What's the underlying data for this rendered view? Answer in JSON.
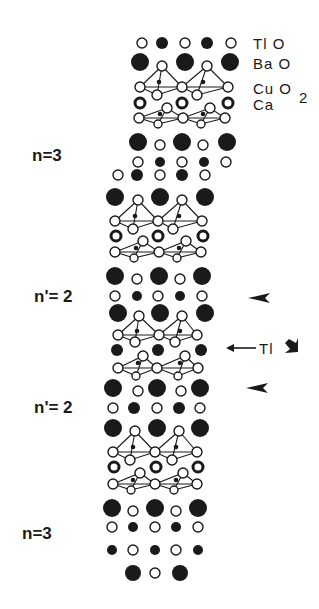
{
  "colors": {
    "ink": "#1a1a1a",
    "background": "#ffffff"
  },
  "legend": {
    "tlo": "Tl O",
    "bao": "Ba O",
    "cuo2": "Cu O",
    "cuo2_sub": "2",
    "ca": "Ca"
  },
  "side_labels": [
    {
      "text": "n=3",
      "x": 32,
      "y": 146
    },
    {
      "text": "n'= 2",
      "x": 34,
      "y": 287
    },
    {
      "text": "n'= 2",
      "x": 34,
      "y": 398
    },
    {
      "text": "n=3",
      "x": 22,
      "y": 524
    }
  ],
  "annotations": {
    "tl_arrow_label": "Tl",
    "arrowheads": [
      {
        "x": 248,
        "y": 298
      },
      {
        "x": 246,
        "y": 388
      }
    ],
    "down_arrow": {
      "x": 292,
      "y": 347
    }
  },
  "atom_rows": [
    {
      "y": 43,
      "atoms": [
        [
          142,
          "o",
          5
        ],
        [
          162,
          "f",
          6
        ],
        [
          185,
          "o",
          5
        ],
        [
          207,
          "f",
          6
        ],
        [
          231,
          "o",
          5
        ]
      ]
    },
    {
      "y": 62,
      "atoms": [
        [
          140,
          "F",
          9
        ],
        [
          185,
          "F",
          9
        ],
        [
          230,
          "F",
          9
        ]
      ]
    },
    {
      "y": 66,
      "atoms": [
        [
          162,
          "o",
          5
        ],
        [
          207,
          "o",
          5
        ]
      ]
    },
    {
      "y": 87,
      "atoms": [
        [
          140,
          "o",
          5
        ],
        [
          182,
          "o",
          5
        ],
        [
          228,
          "o",
          5
        ]
      ]
    },
    {
      "y": 95,
      "atoms": [
        [
          157,
          "o",
          5
        ],
        [
          197,
          "o",
          5
        ]
      ]
    },
    {
      "y": 103,
      "atoms": [
        [
          140,
          "r",
          5
        ],
        [
          182,
          "r",
          5
        ],
        [
          228,
          "r",
          5
        ]
      ]
    },
    {
      "y": 108,
      "atoms": [
        [
          167,
          "o",
          5
        ],
        [
          210,
          "o",
          5
        ]
      ]
    },
    {
      "y": 118,
      "atoms": [
        [
          139,
          "o",
          5
        ],
        [
          183,
          "o",
          5
        ],
        [
          225,
          "o",
          5
        ]
      ]
    },
    {
      "y": 124,
      "atoms": [
        [
          158,
          "o",
          4
        ],
        [
          201,
          "o",
          4
        ]
      ]
    },
    {
      "y": 142,
      "atoms": [
        [
          138,
          "F",
          9
        ],
        [
          182,
          "F",
          9
        ],
        [
          227,
          "F",
          9
        ]
      ]
    },
    {
      "y": 145,
      "atoms": [
        [
          160,
          "o",
          5
        ],
        [
          203,
          "o",
          5
        ]
      ]
    },
    {
      "y": 162,
      "atoms": [
        [
          138,
          "o",
          5
        ],
        [
          160,
          "f",
          5
        ],
        [
          182,
          "o",
          5
        ],
        [
          204,
          "f",
          5
        ],
        [
          226,
          "o",
          5
        ]
      ]
    },
    {
      "y": 175,
      "atoms": [
        [
          118,
          "o",
          5
        ],
        [
          137,
          "f",
          6
        ],
        [
          160,
          "o",
          5
        ],
        [
          182,
          "f",
          6
        ],
        [
          205,
          "o",
          5
        ]
      ]
    },
    {
      "y": 197,
      "atoms": [
        [
          115,
          "F",
          9
        ],
        [
          160,
          "F",
          9
        ],
        [
          205,
          "F",
          9
        ]
      ]
    },
    {
      "y": 200,
      "atoms": [
        [
          138,
          "o",
          5
        ],
        [
          182,
          "o",
          5
        ]
      ]
    },
    {
      "y": 221,
      "atoms": [
        [
          115,
          "o",
          5
        ],
        [
          158,
          "o",
          5
        ],
        [
          202,
          "o",
          5
        ]
      ]
    },
    {
      "y": 229,
      "atoms": [
        [
          133,
          "o",
          5
        ],
        [
          173,
          "o",
          5
        ]
      ]
    },
    {
      "y": 236,
      "atoms": [
        [
          116,
          "r",
          5
        ],
        [
          158,
          "r",
          5
        ],
        [
          203,
          "r",
          5
        ]
      ]
    },
    {
      "y": 241,
      "atoms": [
        [
          143,
          "o",
          5
        ],
        [
          186,
          "o",
          5
        ]
      ]
    },
    {
      "y": 252,
      "atoms": [
        [
          115,
          "o",
          5
        ],
        [
          159,
          "o",
          5
        ],
        [
          201,
          "o",
          5
        ]
      ]
    },
    {
      "y": 258,
      "atoms": [
        [
          134,
          "o",
          4
        ],
        [
          177,
          "o",
          4
        ]
      ]
    },
    {
      "y": 276,
      "atoms": [
        [
          115,
          "F",
          9
        ],
        [
          159,
          "F",
          9
        ],
        [
          202,
          "F",
          9
        ]
      ]
    },
    {
      "y": 279,
      "atoms": [
        [
          137,
          "o",
          5
        ],
        [
          180,
          "o",
          5
        ]
      ]
    },
    {
      "y": 296,
      "atoms": [
        [
          115,
          "o",
          5
        ],
        [
          137,
          "f",
          5
        ],
        [
          158,
          "o",
          5
        ],
        [
          180,
          "f",
          5
        ],
        [
          202,
          "o",
          5
        ]
      ]
    },
    {
      "y": 313,
      "atoms": [
        [
          118,
          "F",
          9
        ],
        [
          160,
          "F",
          9
        ],
        [
          205,
          "F",
          9
        ]
      ]
    },
    {
      "y": 316,
      "atoms": [
        [
          139,
          "o",
          5
        ],
        [
          182,
          "o",
          5
        ]
      ]
    },
    {
      "y": 335,
      "atoms": [
        [
          118,
          "o",
          5
        ],
        [
          159,
          "o",
          5
        ],
        [
          197,
          "o",
          5
        ]
      ]
    },
    {
      "y": 342,
      "atoms": [
        [
          135,
          "o",
          5
        ],
        [
          175,
          "o",
          5
        ]
      ]
    },
    {
      "y": 350,
      "atoms": [
        [
          117,
          "F",
          6
        ],
        [
          158,
          "F",
          6
        ],
        [
          201,
          "F",
          6
        ]
      ]
    },
    {
      "y": 356,
      "atoms": [
        [
          143,
          "o",
          5
        ],
        [
          185,
          "o",
          5
        ]
      ]
    },
    {
      "y": 368,
      "atoms": [
        [
          118,
          "o",
          5
        ],
        [
          157,
          "o",
          5
        ],
        [
          198,
          "o",
          5
        ]
      ]
    },
    {
      "y": 376,
      "atoms": [
        [
          136,
          "o",
          4
        ],
        [
          178,
          "o",
          4
        ]
      ]
    },
    {
      "y": 388,
      "atoms": [
        [
          113,
          "F",
          9
        ],
        [
          157,
          "F",
          9
        ],
        [
          200,
          "F",
          9
        ]
      ]
    },
    {
      "y": 391,
      "atoms": [
        [
          138,
          "o",
          5
        ],
        [
          181,
          "o",
          5
        ]
      ]
    },
    {
      "y": 408,
      "atoms": [
        [
          113,
          "o",
          5
        ],
        [
          134,
          "f",
          6
        ],
        [
          157,
          "o",
          5
        ],
        [
          179,
          "f",
          6
        ],
        [
          200,
          "o",
          5
        ]
      ]
    },
    {
      "y": 428,
      "atoms": [
        [
          113,
          "F",
          9
        ],
        [
          157,
          "F",
          9
        ],
        [
          200,
          "F",
          9
        ]
      ]
    },
    {
      "y": 431,
      "atoms": [
        [
          135,
          "o",
          5
        ],
        [
          179,
          "o",
          5
        ]
      ]
    },
    {
      "y": 452,
      "atoms": [
        [
          113,
          "o",
          5
        ],
        [
          155,
          "o",
          5
        ],
        [
          197,
          "o",
          5
        ]
      ]
    },
    {
      "y": 460,
      "atoms": [
        [
          130,
          "o",
          5
        ],
        [
          172,
          "o",
          5
        ]
      ]
    },
    {
      "y": 467,
      "atoms": [
        [
          114,
          "r",
          5
        ],
        [
          156,
          "r",
          5
        ],
        [
          198,
          "r",
          5
        ]
      ]
    },
    {
      "y": 473,
      "atoms": [
        [
          140,
          "o",
          5
        ],
        [
          183,
          "o",
          5
        ]
      ]
    },
    {
      "y": 484,
      "atoms": [
        [
          113,
          "o",
          5
        ],
        [
          155,
          "o",
          5
        ],
        [
          197,
          "o",
          5
        ]
      ]
    },
    {
      "y": 490,
      "atoms": [
        [
          131,
          "o",
          4
        ],
        [
          174,
          "o",
          4
        ]
      ]
    },
    {
      "y": 508,
      "atoms": [
        [
          112,
          "F",
          9
        ],
        [
          155,
          "F",
          9
        ],
        [
          198,
          "F",
          9
        ]
      ]
    },
    {
      "y": 511,
      "atoms": [
        [
          133,
          "o",
          5
        ],
        [
          176,
          "o",
          5
        ]
      ]
    },
    {
      "y": 527,
      "atoms": [
        [
          112,
          "o",
          5
        ],
        [
          133,
          "f",
          5
        ],
        [
          155,
          "o",
          5
        ],
        [
          176,
          "f",
          5
        ],
        [
          198,
          "o",
          5
        ]
      ]
    },
    {
      "y": 550,
      "atoms": [
        [
          112,
          "f",
          5
        ],
        [
          133,
          "o",
          5
        ],
        [
          155,
          "f",
          5
        ],
        [
          176,
          "o",
          5
        ],
        [
          198,
          "f",
          5
        ]
      ]
    },
    {
      "y": 573,
      "atoms": [
        [
          133,
          "F",
          8
        ],
        [
          155,
          "o",
          5
        ],
        [
          180,
          "F",
          8
        ]
      ]
    }
  ],
  "pyramids": [
    {
      "apex": [
        162,
        66
      ],
      "base": [
        [
          140,
          87
        ],
        [
          157,
          95
        ],
        [
          182,
          87
        ]
      ],
      "core": [
        159,
        82
      ]
    },
    {
      "apex": [
        207,
        66
      ],
      "base": [
        [
          182,
          87
        ],
        [
          197,
          95
        ],
        [
          228,
          87
        ]
      ],
      "core": [
        203,
        82
      ]
    },
    {
      "apex": [
        158,
        124
      ],
      "base": [
        [
          139,
          118
        ],
        [
          167,
          108
        ],
        [
          183,
          118
        ]
      ],
      "core": [
        160,
        114
      ]
    },
    {
      "apex": [
        201,
        124
      ],
      "base": [
        [
          183,
          118
        ],
        [
          210,
          108
        ],
        [
          225,
          118
        ]
      ],
      "core": [
        203,
        114
      ]
    },
    {
      "apex": [
        138,
        200
      ],
      "base": [
        [
          115,
          221
        ],
        [
          133,
          229
        ],
        [
          158,
          221
        ]
      ],
      "core": [
        135,
        216
      ]
    },
    {
      "apex": [
        182,
        200
      ],
      "base": [
        [
          158,
          221
        ],
        [
          173,
          229
        ],
        [
          202,
          221
        ]
      ],
      "core": [
        179,
        216
      ]
    },
    {
      "apex": [
        134,
        258
      ],
      "base": [
        [
          115,
          252
        ],
        [
          143,
          241
        ],
        [
          159,
          252
        ]
      ],
      "core": [
        136,
        248
      ]
    },
    {
      "apex": [
        177,
        258
      ],
      "base": [
        [
          159,
          252
        ],
        [
          186,
          241
        ],
        [
          201,
          252
        ]
      ],
      "core": [
        179,
        248
      ]
    },
    {
      "apex": [
        139,
        316
      ],
      "base": [
        [
          118,
          335
        ],
        [
          135,
          342
        ],
        [
          159,
          335
        ]
      ],
      "core": [
        137,
        331
      ]
    },
    {
      "apex": [
        182,
        316
      ],
      "base": [
        [
          159,
          335
        ],
        [
          175,
          342
        ],
        [
          197,
          335
        ]
      ],
      "core": [
        180,
        331
      ]
    },
    {
      "apex": [
        136,
        376
      ],
      "base": [
        [
          118,
          368
        ],
        [
          143,
          356
        ],
        [
          157,
          368
        ]
      ],
      "core": [
        138,
        363
      ]
    },
    {
      "apex": [
        178,
        376
      ],
      "base": [
        [
          157,
          368
        ],
        [
          185,
          356
        ],
        [
          198,
          368
        ]
      ],
      "core": [
        180,
        363
      ]
    },
    {
      "apex": [
        135,
        431
      ],
      "base": [
        [
          113,
          452
        ],
        [
          130,
          460
        ],
        [
          155,
          452
        ]
      ],
      "core": [
        133,
        447
      ]
    },
    {
      "apex": [
        179,
        431
      ],
      "base": [
        [
          155,
          452
        ],
        [
          172,
          460
        ],
        [
          197,
          452
        ]
      ],
      "core": [
        176,
        447
      ]
    },
    {
      "apex": [
        131,
        490
      ],
      "base": [
        [
          113,
          484
        ],
        [
          140,
          473
        ],
        [
          155,
          484
        ]
      ],
      "core": [
        133,
        480
      ]
    },
    {
      "apex": [
        174,
        490
      ],
      "base": [
        [
          155,
          484
        ],
        [
          183,
          473
        ],
        [
          197,
          484
        ]
      ],
      "core": [
        176,
        480
      ]
    }
  ]
}
